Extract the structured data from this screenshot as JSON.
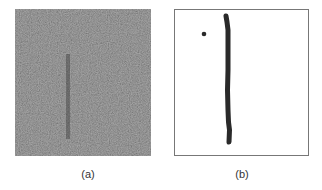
{
  "figure": {
    "panels": [
      {
        "id": "a",
        "caption": "(a)",
        "description": "Noisy grayscale image with faint dark vertical streak",
        "base_color": "#5a5a5a"
      },
      {
        "id": "b",
        "caption": "(b)",
        "description": "Binary result showing a thick dark vertical line and a small isolated dot on white background",
        "stroke_color": "#2a2a2a"
      }
    ]
  }
}
